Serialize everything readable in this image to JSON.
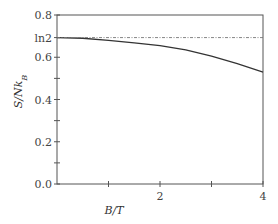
{
  "chart_data": {
    "type": "line",
    "title": "",
    "xlabel": "B/T",
    "ylabel": "S/Nk_B",
    "ylabel_parts": {
      "main": "S/Nk",
      "sub": "B"
    },
    "xlim": [
      0,
      4
    ],
    "ylim": [
      0,
      0.8
    ],
    "grid": false,
    "x_ticks": [
      {
        "value": 1,
        "label": ""
      },
      {
        "value": 2,
        "label": "2"
      },
      {
        "value": 3,
        "label": ""
      },
      {
        "value": 4,
        "label": "4"
      }
    ],
    "y_ticks": [
      {
        "value": 0.0,
        "label": "0.0"
      },
      {
        "value": 0.1,
        "label": ""
      },
      {
        "value": 0.2,
        "label": "0.2"
      },
      {
        "value": 0.3,
        "label": ""
      },
      {
        "value": 0.4,
        "label": "0.4"
      },
      {
        "value": 0.5,
        "label": ""
      },
      {
        "value": 0.6,
        "label": "0.6"
      },
      {
        "value": 0.6931,
        "label": "ln2"
      },
      {
        "value": 0.8,
        "label": "0.8"
      }
    ],
    "series": [
      {
        "name": "entropy",
        "style": "solid",
        "color": "#333333",
        "x": [
          0,
          0.5,
          1,
          1.5,
          2,
          2.5,
          3,
          3.5,
          4
        ],
        "y": [
          0.693,
          0.69,
          0.68,
          0.668,
          0.655,
          0.635,
          0.605,
          0.57,
          0.53
        ]
      },
      {
        "name": "ln2 limit",
        "style": "dash-dot",
        "color": "#777777",
        "x": [
          0,
          4
        ],
        "y": [
          0.6931,
          0.6931
        ]
      }
    ]
  }
}
